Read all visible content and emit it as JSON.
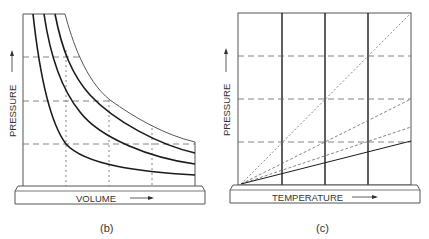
{
  "panels": [
    {
      "id": "b",
      "caption": "(b)",
      "ylabel": "PRESSURE",
      "xlabel": "VOLUME",
      "description": "Isotherms: pressure vs volume hyperbolas (Boyle's law)"
    },
    {
      "id": "c",
      "caption": "(c)",
      "ylabel": "PRESSURE",
      "xlabel": "TEMPERATURE",
      "description": "Pressure vs temperature straight lines from origin at constant volume"
    }
  ],
  "colors": {
    "line": "#1a1a1a",
    "thin": "#444444",
    "dash": "#666666",
    "text": "#333333"
  }
}
